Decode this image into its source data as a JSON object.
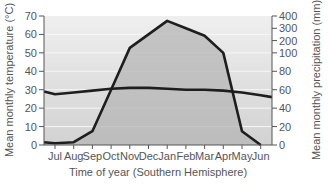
{
  "chart_data": {
    "type": "line",
    "title": "",
    "xlabel": "Time of year (Southern Hemisphere)",
    "ylabel": "Mean monthly temperature (°C)",
    "ylabel_right": "Mean monthly precipitation (mm)",
    "categories": [
      "Jul",
      "Aug",
      "Sep",
      "Oct",
      "Nov",
      "Dec",
      "Jan",
      "Feb",
      "Mar",
      "Apr",
      "May",
      "Jun"
    ],
    "series": [
      {
        "name": "Mean monthly temperature (°C)",
        "axis": "left",
        "values": [
          27.5,
          28.5,
          29.5,
          30.5,
          31,
          31,
          30.5,
          30,
          30,
          29.5,
          28.5,
          27
        ]
      },
      {
        "name": "Mean monthly precipitation (mm)",
        "axis": "right",
        "fill": true,
        "values": [
          2,
          3,
          15,
          60,
          140,
          250,
          360,
          300,
          240,
          100,
          15,
          0
        ]
      }
    ],
    "ylim_left": [
      0,
      70
    ],
    "yticks_left": [
      0,
      10,
      20,
      30,
      40,
      50,
      60,
      70
    ],
    "ylim_right": [
      0,
      400
    ],
    "yticks_right": [
      0,
      20,
      40,
      60,
      80,
      100,
      200,
      300,
      400
    ],
    "right_axis_note": "non-linear: 0-100 linear, 100-400 compressed",
    "grid": true,
    "legend": "none"
  },
  "colors": {
    "plot_bg_top": "#eeeeee",
    "plot_bg_bottom": "#d4d4d4",
    "precip_fill": "#b9b9b9",
    "line": "#1e1e1e",
    "gridline": "#f4f4f4",
    "axis": "#555555"
  }
}
